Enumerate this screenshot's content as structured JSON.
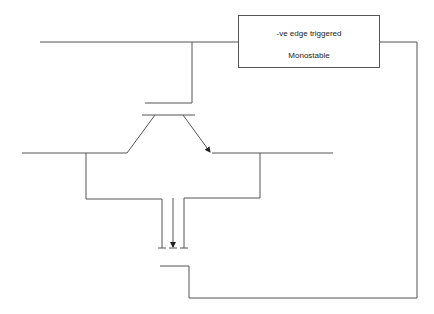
{
  "diagram": {
    "type": "circuit-schematic",
    "monostable_box": {
      "line1": "-ve edge triggered",
      "line2": "Monostable"
    },
    "components": [
      {
        "name": "monostable",
        "label": "-ve edge triggered Monostable"
      },
      {
        "name": "transistor",
        "label": "",
        "terminals": [
          "gate",
          "source",
          "drain"
        ]
      },
      {
        "name": "mosfet-symbol",
        "label": "",
        "arrow": "down"
      }
    ],
    "colors": {
      "line": "#555555",
      "background": "#ffffff"
    }
  }
}
